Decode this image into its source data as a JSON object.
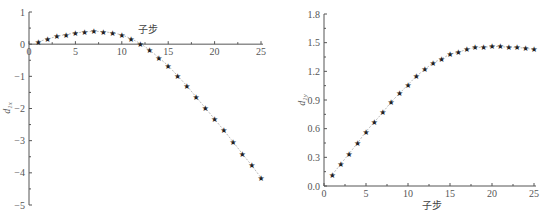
{
  "chart_data": [
    {
      "type": "line",
      "title": "",
      "xlabel": "子步",
      "ylabel": "d_1x",
      "ylabel_main": "d",
      "ylabel_sub": "1x",
      "xlim": [
        0,
        25
      ],
      "ylim": [
        -5,
        1
      ],
      "xticks": [
        0,
        5,
        10,
        15,
        20,
        25
      ],
      "yticks": [
        1,
        0,
        -1,
        -2,
        -3,
        -4,
        -5
      ],
      "xtick_labels": [
        "0",
        "5",
        "10",
        "15",
        "20",
        "25"
      ],
      "ytick_labels": [
        "1",
        "0",
        "−1",
        "−2",
        "−3",
        "−4",
        "−5"
      ],
      "grid": false,
      "marker": "star",
      "x": [
        1,
        2,
        3,
        4,
        5,
        6,
        7,
        8,
        9,
        10,
        11,
        12,
        13,
        14,
        15,
        16,
        17,
        18,
        19,
        20,
        21,
        22,
        23,
        24,
        25
      ],
      "values": [
        0.08,
        0.16,
        0.24,
        0.3,
        0.35,
        0.38,
        0.4,
        0.39,
        0.35,
        0.29,
        0.17,
        0.02,
        -0.18,
        -0.42,
        -0.67,
        -0.98,
        -1.29,
        -1.64,
        -1.98,
        -2.33,
        -2.68,
        -3.04,
        -3.41,
        -3.77,
        -4.15
      ]
    },
    {
      "type": "line",
      "title": "",
      "xlabel": "子步",
      "ylabel": "d_1y",
      "ylabel_main": "d",
      "ylabel_sub": "1y",
      "xlim": [
        0,
        25
      ],
      "ylim": [
        0,
        1.8
      ],
      "xticks": [
        0,
        5,
        10,
        15,
        20,
        25
      ],
      "yticks": [
        0,
        0.3,
        0.6,
        0.9,
        1.2,
        1.5,
        1.8
      ],
      "xtick_labels": [
        "0",
        "5",
        "10",
        "15",
        "20",
        "25"
      ],
      "ytick_labels": [
        "0.0",
        "0.3",
        "0.6",
        "0.9",
        "1.2",
        "1.5",
        "1.8"
      ],
      "grid": false,
      "marker": "star",
      "x": [
        1,
        2,
        3,
        4,
        5,
        6,
        7,
        8,
        9,
        10,
        11,
        12,
        13,
        14,
        15,
        16,
        17,
        18,
        19,
        20,
        21,
        22,
        23,
        24,
        25
      ],
      "values": [
        0.12,
        0.23,
        0.34,
        0.45,
        0.57,
        0.67,
        0.77,
        0.88,
        0.97,
        1.06,
        1.15,
        1.22,
        1.29,
        1.33,
        1.38,
        1.4,
        1.43,
        1.45,
        1.45,
        1.46,
        1.46,
        1.45,
        1.45,
        1.44,
        1.43
      ]
    }
  ],
  "left": {
    "xlabel": "子步"
  },
  "right": {
    "xlabel": "子步"
  },
  "star_glyph": "★"
}
